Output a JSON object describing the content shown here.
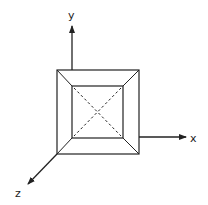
{
  "diagram": {
    "type": "3d-axes-with-frustum-top-view",
    "axes": {
      "x": {
        "label": "x"
      },
      "y": {
        "label": "y"
      },
      "z": {
        "label": "z"
      }
    },
    "colors": {
      "stroke": "#222222",
      "background": "#ffffff"
    }
  }
}
